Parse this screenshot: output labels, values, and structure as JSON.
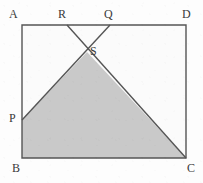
{
  "figure": {
    "shape": "square",
    "canvas": {
      "width": 203,
      "height": 183
    },
    "colors": {
      "background": "#fdfdfd",
      "stroke": "#555555",
      "shaded_fill": "#c9c9c9",
      "unshaded_fill": "#fbfbfb",
      "label_text": "#3a3a3a"
    },
    "stroke_width": 1.4,
    "square": {
      "corners": [
        {
          "id": "A",
          "label": "A",
          "x": 22,
          "y": 25
        },
        {
          "id": "D",
          "label": "D",
          "x": 186,
          "y": 25
        },
        {
          "id": "C",
          "label": "C",
          "x": 186,
          "y": 158
        },
        {
          "id": "B",
          "label": "B",
          "x": 22,
          "y": 158
        }
      ]
    },
    "points": [
      {
        "id": "A",
        "label": "A",
        "x": 22,
        "y": 25,
        "label_x": 9,
        "label_y": 8,
        "on": "corner-top-left"
      },
      {
        "id": "R",
        "label": "R",
        "x": 67,
        "y": 25,
        "label_x": 58,
        "label_y": 8,
        "on": "side-AD"
      },
      {
        "id": "Q",
        "label": "Q",
        "x": 110,
        "y": 25,
        "label_x": 104,
        "label_y": 8,
        "on": "side-AD"
      },
      {
        "id": "D",
        "label": "D",
        "x": 186,
        "y": 25,
        "label_x": 182,
        "label_y": 8,
        "on": "corner-top-right"
      },
      {
        "id": "S",
        "label": "S",
        "x": 87,
        "y": 52,
        "label_x": 90,
        "label_y": 45,
        "on": "intersection"
      },
      {
        "id": "P",
        "label": "P",
        "x": 22,
        "y": 120,
        "label_x": 9,
        "label_y": 112,
        "on": "side-AB"
      },
      {
        "id": "B",
        "label": "B",
        "x": 22,
        "y": 158,
        "label_x": 12,
        "label_y": 162,
        "on": "corner-bottom-left"
      },
      {
        "id": "C",
        "label": "C",
        "x": 186,
        "y": 158,
        "label_x": 187,
        "label_y": 162,
        "on": "corner-bottom-right"
      }
    ],
    "segments": [
      {
        "id": "RC",
        "from": "R",
        "to": "C",
        "description": "line from R on top edge through S to corner C"
      },
      {
        "id": "QP",
        "from": "Q",
        "to": "P",
        "description": "line from Q on top edge through S to P on left edge"
      }
    ],
    "shaded_region": {
      "id": "PSCB",
      "vertices": [
        "P",
        "S",
        "C",
        "B"
      ],
      "description": "quadrilateral P-S-C-B shaded gray"
    }
  }
}
